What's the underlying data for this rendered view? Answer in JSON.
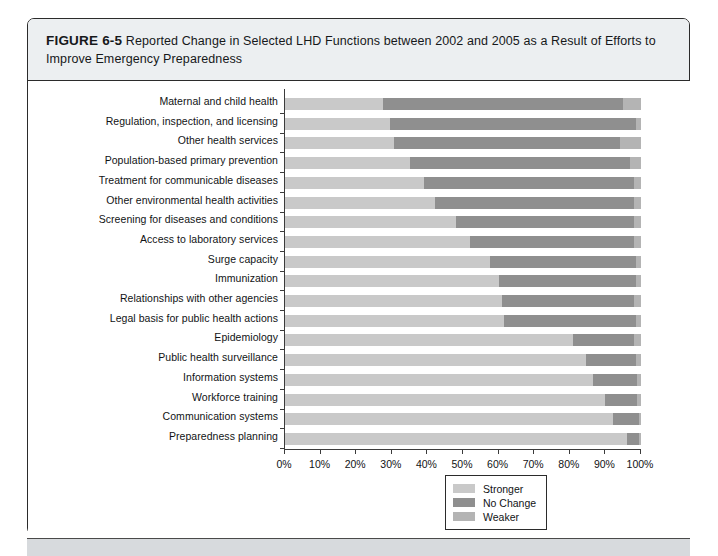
{
  "figure": {
    "label": "FIGURE 6-5",
    "caption": "Reported Change in Selected LHD Functions between 2002 and 2005 as a Result of Efforts to Improve Emergency Preparedness"
  },
  "colors": {
    "stronger": "#c9c9c9",
    "no_change": "#8f8f8f",
    "weaker": "#b4b4b4",
    "axis": "#3b3b3b",
    "caption_band": "#eceff1",
    "frame": "#2b2b2b"
  },
  "legend": {
    "position": "bottom-center",
    "entries": [
      {
        "label": "Stronger",
        "color": "#c9c9c9",
        "swatch": "stronger-swatch"
      },
      {
        "label": "No Change",
        "color": "#8f8f8f",
        "swatch": "no-change-swatch"
      },
      {
        "label": "Weaker",
        "color": "#b4b4b4",
        "swatch": "weaker-swatch"
      }
    ]
  },
  "chart_data": {
    "type": "bar",
    "orientation": "horizontal",
    "stacked": true,
    "stack_mode": "percent",
    "title": "Reported Change in Selected LHD Functions between 2002 and 2005 as a Result of Efforts to Improve Emergency Preparedness",
    "subtitle": "",
    "xlabel": "",
    "ylabel": "",
    "xlim": [
      0,
      100
    ],
    "xticks": [
      0,
      10,
      20,
      30,
      40,
      50,
      60,
      70,
      80,
      90,
      100
    ],
    "xtick_labels": [
      "0%",
      "10%",
      "20%",
      "30%",
      "40%",
      "50%",
      "60%",
      "70%",
      "80%",
      "90%",
      "100%"
    ],
    "grid": false,
    "legend_position": "bottom-center",
    "categories": [
      "Maternal and child health",
      "Regulation, inspection, and licensing",
      "Other health services",
      "Population-based primary prevention",
      "Treatment for communicable diseases",
      "Other environmental health activities",
      "Screening for diseases and conditions",
      "Access to laboratory services",
      "Surge capacity",
      "Immunization",
      "Relationships with other agencies",
      "Legal basis for public health actions",
      "Epidemiology",
      "Public health surveillance",
      "Information systems",
      "Workforce training",
      "Communication systems",
      "Preparedness planning"
    ],
    "series": [
      {
        "name": "Stronger",
        "color": "#c9c9c9",
        "values": [
          27.5,
          29.5,
          30.5,
          35.0,
          39.0,
          42.0,
          48.0,
          52.0,
          57.5,
          60.0,
          61.0,
          61.5,
          81.0,
          84.5,
          86.5,
          90.0,
          92.0,
          96.0
        ]
      },
      {
        "name": "No Change",
        "color": "#8f8f8f",
        "values": [
          67.5,
          69.0,
          63.5,
          62.0,
          59.0,
          56.0,
          50.0,
          46.0,
          41.0,
          38.5,
          37.0,
          37.0,
          17.0,
          14.0,
          12.5,
          9.0,
          7.5,
          3.5
        ]
      },
      {
        "name": "Weaker",
        "color": "#b4b4b4",
        "values": [
          5.0,
          1.5,
          6.0,
          3.0,
          2.0,
          2.0,
          2.0,
          2.0,
          1.5,
          1.5,
          2.0,
          1.5,
          2.0,
          1.5,
          1.0,
          1.0,
          0.5,
          0.5
        ]
      }
    ]
  }
}
